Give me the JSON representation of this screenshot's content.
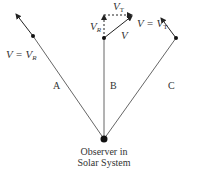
{
  "diagram": {
    "colors": {
      "line": "#555555",
      "dot": "#111111",
      "text": "#333333"
    },
    "observer": {
      "label_line1": "Observer in",
      "label_line2": "Solar System"
    },
    "paths": [
      {
        "id": "A",
        "label": "A",
        "velocity_label": "V = V",
        "velocity_sub": "R"
      },
      {
        "id": "B",
        "label": "B",
        "components": {
          "radial": "V",
          "radial_sub": "R",
          "transverse": "V",
          "transverse_sub": "T",
          "total": "V"
        }
      },
      {
        "id": "C",
        "label": "C",
        "velocity_label": "V = V",
        "velocity_sub": "T"
      }
    ]
  }
}
